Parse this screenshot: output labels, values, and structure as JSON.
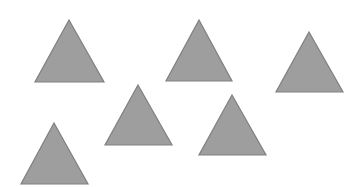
{
  "image": {
    "title": "Scattered gray triangles",
    "width": 363,
    "height": 187,
    "background_color": "#ffffff",
    "shape_count": 6,
    "shape_type": "triangle"
  },
  "style": {
    "fill_color": "#9e9e9e",
    "stroke_color": "#808080",
    "stroke_width": 1.2
  },
  "shapes": [
    {
      "name": "triangle-top-left",
      "label": "Triangle 1",
      "apex_x": 69,
      "apex_y": 20,
      "base_left_x": 35,
      "base_right_x": 104,
      "base_y": 82,
      "width": 69,
      "height": 62,
      "points": "69,20 104,82 35,82"
    },
    {
      "name": "triangle-top-center",
      "label": "Triangle 2",
      "apex_x": 199,
      "apex_y": 20,
      "base_left_x": 166,
      "base_right_x": 232,
      "base_y": 81,
      "width": 66,
      "height": 61,
      "points": "199,20 232,81 166,81"
    },
    {
      "name": "triangle-top-right",
      "label": "Triangle 3",
      "apex_x": 309,
      "apex_y": 32,
      "base_left_x": 276,
      "base_right_x": 343,
      "base_y": 92,
      "width": 67,
      "height": 60,
      "points": "309,32 343,92 276,92"
    },
    {
      "name": "triangle-middle-center",
      "label": "Triangle 4",
      "apex_x": 138,
      "apex_y": 85,
      "base_left_x": 105,
      "base_right_x": 172,
      "base_y": 145,
      "width": 67,
      "height": 60,
      "points": "138,85 172,145 105,145"
    },
    {
      "name": "triangle-middle-right",
      "label": "Triangle 5",
      "apex_x": 232,
      "apex_y": 95,
      "base_left_x": 199,
      "base_right_x": 266,
      "base_y": 155,
      "width": 67,
      "height": 60,
      "points": "232,95 266,155 199,155"
    },
    {
      "name": "triangle-bottom-left",
      "label": "Triangle 6",
      "apex_x": 54,
      "apex_y": 123,
      "base_left_x": 21,
      "base_right_x": 88,
      "base_y": 184,
      "width": 67,
      "height": 61,
      "points": "54,123 88,184 21,184"
    }
  ]
}
